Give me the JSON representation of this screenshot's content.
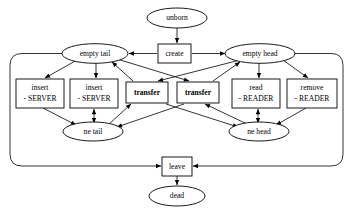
{
  "diagram": {
    "type": "state-transition-diagram",
    "background_color": "#ffffff",
    "line_color": "#000000",
    "nodes": {
      "unborn": {
        "label": "unborn",
        "shape": "ellipse",
        "cx": 177,
        "cy": 18,
        "rx": 30,
        "ry": 10
      },
      "empty_tail": {
        "label": "empty tail",
        "shape": "ellipse",
        "cx": 95,
        "cy": 53,
        "rx": 32,
        "ry": 9.5
      },
      "create": {
        "label": "create",
        "shape": "rect",
        "x": 158,
        "y": 44,
        "w": 33,
        "h": 19
      },
      "empty_head": {
        "label": "empty head",
        "shape": "ellipse",
        "cx": 261,
        "cy": 53,
        "rx": 34,
        "ry": 9.5
      },
      "insert_server_1": {
        "line1": "insert",
        "line2": "- SERVER",
        "shape": "rect",
        "x": 16,
        "y": 79,
        "w": 48,
        "h": 28
      },
      "insert_server_2": {
        "line1": "insert",
        "line2": "- SERVER",
        "shape": "rect",
        "x": 70,
        "y": 79,
        "w": 48,
        "h": 28
      },
      "transfer_1": {
        "label": "transfer",
        "bold": true,
        "shape": "rect",
        "x": 126,
        "y": 82,
        "w": 42,
        "h": 21
      },
      "transfer_2": {
        "label": "transfer",
        "bold": true,
        "shape": "rect",
        "x": 177,
        "y": 82,
        "w": 42,
        "h": 21
      },
      "read_reader": {
        "line1": "read",
        "line2": "- READER",
        "shape": "rect",
        "x": 232,
        "y": 79,
        "w": 48,
        "h": 28
      },
      "remove_reader": {
        "line1": "remove",
        "line2": "- READER",
        "shape": "rect",
        "x": 287,
        "y": 79,
        "w": 50,
        "h": 28
      },
      "ne_tail": {
        "label": "ne tail",
        "shape": "ellipse",
        "cx": 93,
        "cy": 131,
        "rx": 29,
        "ry": 9.5
      },
      "ne_head": {
        "label": "ne head",
        "shape": "ellipse",
        "cx": 259,
        "cy": 131,
        "rx": 29,
        "ry": 9.5
      },
      "leave": {
        "label": "leave",
        "shape": "rect",
        "x": 162,
        "y": 157,
        "w": 30,
        "h": 19
      },
      "dead": {
        "label": "dead",
        "shape": "ellipse",
        "cx": 177,
        "cy": 196,
        "rx": 27,
        "ry": 10
      }
    },
    "edges": [
      {
        "from": "unborn",
        "to": "create",
        "arrow": "single"
      },
      {
        "from": "create",
        "to": "empty_tail",
        "arrow": "single"
      },
      {
        "from": "create",
        "to": "empty_head",
        "arrow": "single"
      },
      {
        "from": "empty_tail",
        "to": "insert_server_1",
        "arrow": "single"
      },
      {
        "from": "empty_tail",
        "to": "insert_server_2",
        "arrow": "single"
      },
      {
        "from": "empty_tail",
        "to": "transfer_2",
        "arrow": "single"
      },
      {
        "from": "transfer_1",
        "to": "empty_tail",
        "arrow": "single"
      },
      {
        "from": "empty_head",
        "to": "transfer_1",
        "arrow": "single"
      },
      {
        "from": "empty_head",
        "to": "read_reader",
        "arrow": "single"
      },
      {
        "from": "empty_head",
        "to": "remove_reader",
        "arrow": "single"
      },
      {
        "from": "transfer_2",
        "to": "empty_head",
        "arrow": "single"
      },
      {
        "from": "insert_server_1",
        "to": "ne_tail",
        "arrow": "single"
      },
      {
        "from": "insert_server_2",
        "to": "ne_tail",
        "arrow": "double"
      },
      {
        "from": "ne_tail",
        "to": "transfer_1",
        "arrow": "single"
      },
      {
        "from": "transfer_2",
        "to": "ne_tail",
        "arrow": "single"
      },
      {
        "from": "transfer_1",
        "to": "ne_head",
        "arrow": "single"
      },
      {
        "from": "ne_head",
        "to": "transfer_2",
        "arrow": "single"
      },
      {
        "from": "read_reader",
        "to": "ne_head",
        "arrow": "double"
      },
      {
        "from": "remove_reader",
        "to": "ne_head",
        "arrow": "single"
      },
      {
        "from": "empty_tail",
        "to": "leave",
        "arrow": "single",
        "routing": "left-outer-loop"
      },
      {
        "from": "empty_head",
        "to": "leave",
        "arrow": "single",
        "routing": "right-outer-loop"
      },
      {
        "from": "leave",
        "to": "dead",
        "arrow": "single"
      }
    ]
  }
}
